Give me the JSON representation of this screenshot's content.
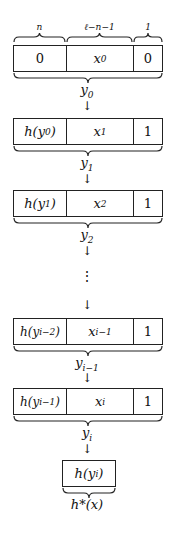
{
  "top_braces": [
    {
      "label": "n",
      "x": 13,
      "w": 53
    },
    {
      "label": "ℓ−n−1",
      "x": 66,
      "w": 67
    },
    {
      "label": "1",
      "x": 133,
      "w": 30
    }
  ],
  "rows": [
    {
      "top": 45,
      "c1": "0",
      "c1_italic": false,
      "c2": "x",
      "c2_sub": "0",
      "c3": "0",
      "brace_label": "y",
      "brace_sub": "0"
    },
    {
      "top": 118,
      "c1": "h(y",
      "c1_sub": "0",
      "c1_end": ")",
      "c2": "x",
      "c2_sub": "1",
      "c3": "1",
      "brace_label": "y",
      "brace_sub": "1"
    },
    {
      "top": 190,
      "c1": "h(y",
      "c1_sub": "1",
      "c1_end": ")",
      "c2": "x",
      "c2_sub": "2",
      "c3": "1",
      "brace_label": "y",
      "brace_sub": "2"
    },
    {
      "top": 318,
      "c1": "h(y",
      "c1_sub": "i−2",
      "c1_end": ")",
      "c2": "x",
      "c2_sub": "i−1",
      "c3": "1",
      "brace_label": "y",
      "brace_sub": "i−1"
    },
    {
      "top": 388,
      "c1": "h(y",
      "c1_sub": "i−1",
      "c1_end": ")",
      "c2": "x",
      "c2_sub": "i",
      "c3": "1",
      "brace_label": "y",
      "brace_sub": "i"
    }
  ],
  "arrows": [
    "↓",
    "↓",
    "↓",
    "↓",
    "↓",
    "↓"
  ],
  "ellipsis": "⋮",
  "final": {
    "text": "h(y",
    "sub": "i",
    "end": ")",
    "label": "h*(x)"
  }
}
